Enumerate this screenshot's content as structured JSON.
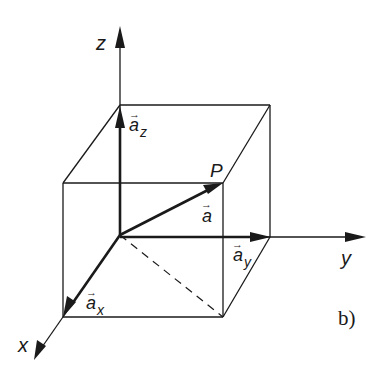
{
  "figure": {
    "panel_label": "b)",
    "axes": {
      "x_label": "x",
      "y_label": "y",
      "z_label": "z"
    },
    "point_label": "P",
    "vector": {
      "base": "a",
      "arrow": "→"
    },
    "components": [
      {
        "base": "a",
        "sub": "x"
      },
      {
        "base": "a",
        "sub": "y"
      },
      {
        "base": "a",
        "sub": "z"
      }
    ],
    "colors": {
      "line": "#1a1a1a",
      "background": "#ffffff"
    }
  }
}
